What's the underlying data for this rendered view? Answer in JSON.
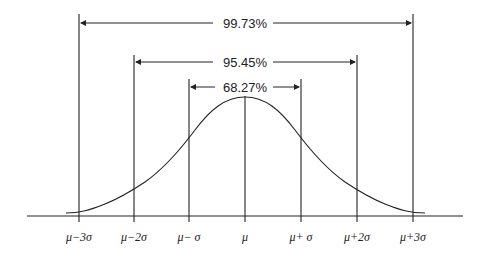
{
  "diagram": {
    "intervals": [
      {
        "label": "99.73%",
        "range": "μ±3σ"
      },
      {
        "label": "95.45%",
        "range": "μ±2σ"
      },
      {
        "label": "68.27%",
        "range": "μ±σ"
      }
    ],
    "axis_labels": [
      "μ−3σ",
      "μ−2σ",
      "μ− σ",
      "μ",
      "μ+ σ",
      "μ+2σ",
      "μ+3σ"
    ],
    "colors": {
      "line": "#222222",
      "background": "#ffffff"
    }
  }
}
